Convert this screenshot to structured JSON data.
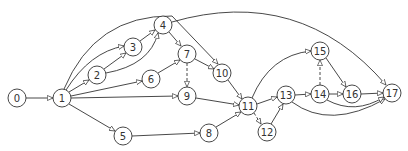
{
  "diagram": {
    "type": "directed-graph",
    "node_radius": 9,
    "stroke_color": "#333333",
    "nodes": [
      {
        "id": "0",
        "label": "0",
        "x": 17,
        "y": 98
      },
      {
        "id": "1",
        "label": "1",
        "x": 62,
        "y": 98
      },
      {
        "id": "2",
        "label": "2",
        "x": 97,
        "y": 75
      },
      {
        "id": "3",
        "label": "3",
        "x": 133,
        "y": 47
      },
      {
        "id": "4",
        "label": "4",
        "x": 163,
        "y": 25
      },
      {
        "id": "5",
        "label": "5",
        "x": 123,
        "y": 136
      },
      {
        "id": "6",
        "label": "6",
        "x": 151,
        "y": 79
      },
      {
        "id": "7",
        "label": "7",
        "x": 187,
        "y": 54
      },
      {
        "id": "8",
        "label": "8",
        "x": 209,
        "y": 133
      },
      {
        "id": "9",
        "label": "9",
        "x": 187,
        "y": 96
      },
      {
        "id": "10",
        "label": "10",
        "x": 222,
        "y": 73
      },
      {
        "id": "11",
        "label": "11",
        "x": 248,
        "y": 106
      },
      {
        "id": "12",
        "label": "12",
        "x": 267,
        "y": 132
      },
      {
        "id": "13",
        "label": "13",
        "x": 286,
        "y": 95
      },
      {
        "id": "14",
        "label": "14",
        "x": 320,
        "y": 94
      },
      {
        "id": "15",
        "label": "15",
        "x": 320,
        "y": 51
      },
      {
        "id": "16",
        "label": "16",
        "x": 352,
        "y": 94
      },
      {
        "id": "17",
        "label": "17",
        "x": 392,
        "y": 93
      }
    ],
    "edges": [
      {
        "from": "0",
        "to": "1",
        "style": "solid",
        "path": "M26,98 L53,98"
      },
      {
        "from": "1",
        "to": "2",
        "style": "solid",
        "path": "M69,92 L89,80"
      },
      {
        "from": "1",
        "to": "3",
        "style": "solid",
        "path": "M66,90 Q90,52 124,46"
      },
      {
        "from": "1",
        "to": "10",
        "style": "solid",
        "path": "M64,89 Q95,15 172,16 L218,64"
      },
      {
        "from": "1",
        "to": "6",
        "style": "solid",
        "path": "M71,96 L142,81"
      },
      {
        "from": "1",
        "to": "9",
        "style": "solid",
        "path": "M71,98 L178,96"
      },
      {
        "from": "1",
        "to": "5",
        "style": "solid",
        "path": "M69,104 L115,131"
      },
      {
        "from": "2",
        "to": "3",
        "style": "solid",
        "path": "M104,69 L126,53"
      },
      {
        "from": "2",
        "to": "4",
        "style": "solid",
        "path": "M106,73 Q150,65 158,33"
      },
      {
        "from": "3",
        "to": "4",
        "style": "solid",
        "path": "M140,41 L155,30"
      },
      {
        "from": "4",
        "to": "7",
        "style": "solid",
        "path": "M169,32 L181,46"
      },
      {
        "from": "4",
        "to": "17",
        "style": "solid",
        "path": "M172,22 Q300,-15 386,85"
      },
      {
        "from": "5",
        "to": "8",
        "style": "solid",
        "path": "M132,136 L200,133"
      },
      {
        "from": "6",
        "to": "7",
        "style": "solid",
        "path": "M158,73 L180,60"
      },
      {
        "from": "7",
        "to": "10",
        "style": "solid",
        "path": "M195,59 L214,69"
      },
      {
        "from": "7",
        "to": "9",
        "style": "dashed",
        "path": "M187,63 L187,87"
      },
      {
        "from": "9",
        "to": "11",
        "style": "solid",
        "path": "M196,98 L239,105"
      },
      {
        "from": "10",
        "to": "11",
        "style": "solid",
        "path": "M228,80 L242,99"
      },
      {
        "from": "8",
        "to": "11",
        "style": "solid",
        "path": "M216,127 L241,112"
      },
      {
        "from": "11",
        "to": "12",
        "style": "dashed",
        "path": "M254,113 L261,124"
      },
      {
        "from": "11",
        "to": "13",
        "style": "solid",
        "path": "M257,104 L277,97"
      },
      {
        "from": "11",
        "to": "15",
        "style": "solid",
        "path": "M252,98 Q270,55 311,51"
      },
      {
        "from": "12",
        "to": "13",
        "style": "solid",
        "path": "M271,124 L283,104"
      },
      {
        "from": "13",
        "to": "14",
        "style": "solid",
        "path": "M295,95 L311,94"
      },
      {
        "from": "13",
        "to": "17",
        "style": "solid",
        "path": "M292,102 Q330,130 385,99"
      },
      {
        "from": "14",
        "to": "15",
        "style": "dashed",
        "path": "M320,85 L320,60"
      },
      {
        "from": "14",
        "to": "16",
        "style": "solid",
        "path": "M329,94 L343,94"
      },
      {
        "from": "14",
        "to": "17",
        "style": "solid",
        "path": "M327,100 Q355,115 384,97"
      },
      {
        "from": "15",
        "to": "16",
        "style": "solid",
        "path": "M326,58 L346,87"
      },
      {
        "from": "16",
        "to": "17",
        "style": "solid",
        "path": "M361,94 L383,93"
      }
    ]
  }
}
